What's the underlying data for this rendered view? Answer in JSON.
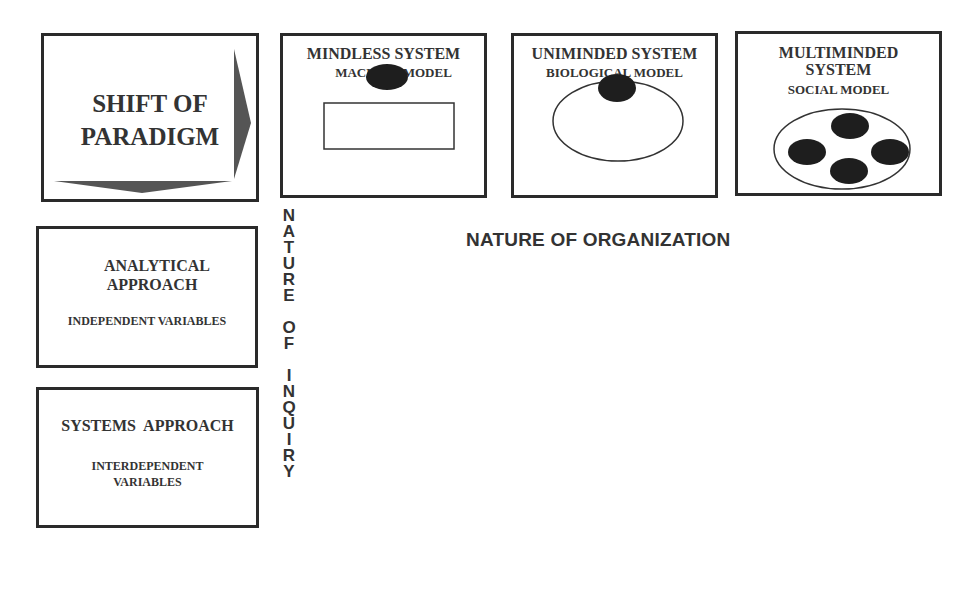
{
  "paradigm_box": {
    "title_line1": "SHIFT OF",
    "title_line2": "PARADIGM",
    "arrows": [
      "arrow-right-icon",
      "arrow-down-icon"
    ]
  },
  "organization_models": [
    {
      "title": "MINDLESS SYSTEM",
      "subtitle": "MACHINE MODEL",
      "figure": "oval-above-rectangle"
    },
    {
      "title": "UNIMINDED SYSTEM",
      "subtitle": "BIOLOGICAL MODEL",
      "figure": "dark-oval-inside-ellipse"
    },
    {
      "title_line1": "MULTIMINDED",
      "title_line2": "SYSTEM",
      "subtitle": "SOCIAL MODEL",
      "figure": "four-dark-ovals-inside-ellipse"
    }
  ],
  "inquiry_approaches": [
    {
      "title_line1": "ANALYTICAL",
      "title_line2": "APPROACH",
      "subtitle": "INDEPENDENT VARIABLES"
    },
    {
      "title": "SYSTEMS  APPROACH",
      "subtitle_line1": "INTERDEPENDENT",
      "subtitle_line2": "VARIABLES"
    }
  ],
  "axis_labels": {
    "horizontal": "NATURE OF ORGANIZATION",
    "vertical_words": [
      "NATURE",
      "OF",
      "INQUIRY"
    ]
  },
  "colors": {
    "border": "#2a2a2a",
    "text": "#333333",
    "filled_oval": "#1e1e1e",
    "arrow_fill": "#555555"
  }
}
